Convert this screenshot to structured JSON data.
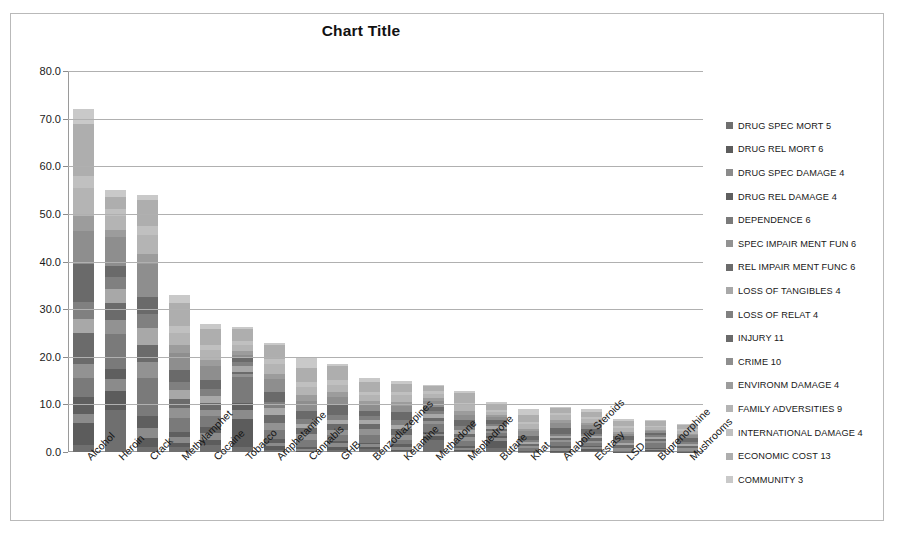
{
  "chart_data": {
    "type": "bar",
    "subtype": "stacked-column",
    "title": "Chart Title",
    "xlabel": "",
    "ylabel": "",
    "ylim": [
      0,
      80
    ],
    "ytick_step": 10,
    "ytick_labels": [
      "0.0",
      "10.0",
      "20.0",
      "30.0",
      "40.0",
      "50.0",
      "60.0",
      "70.0",
      "80.0"
    ],
    "grid": true,
    "legend_position": "right",
    "categories": [
      "Alcohol",
      "Heroin",
      "Crack",
      "Methylamphet",
      "Cocaine",
      "Tobacco",
      "Amphetamine",
      "Cannabis",
      "GHB",
      "Benzodiazepines",
      "Ketamine",
      "Methadone",
      "Mephedrone",
      "Butane",
      "Khat",
      "Anabolic Steroids",
      "Ecstasy",
      "LSD",
      "Buprenorphine",
      "Mushrooms"
    ],
    "totals": [
      72,
      55,
      54,
      33,
      27,
      26.3,
      23,
      20,
      18.5,
      15.5,
      15,
      14,
      12.8,
      10.5,
      9,
      9.5,
      9,
      7,
      6.8,
      6
    ],
    "series": [
      {
        "name": "DRUG SPEC MORT 5",
        "color": "#6f6f6f",
        "values": [
          1.5,
          9.0,
          1.0,
          1.0,
          1.5,
          1.0,
          0.5,
          0.0,
          0.5,
          0.6,
          0.2,
          2.5,
          0.2,
          0.8,
          0.0,
          0.1,
          0.3,
          0.0,
          0.3,
          0.0
        ]
      },
      {
        "name": "DRUG REL MORT 6",
        "color": "#5c5c5c",
        "values": [
          4.5,
          4.0,
          2.0,
          0.8,
          1.2,
          6.0,
          0.8,
          0.3,
          0.6,
          0.5,
          0.3,
          0.8,
          0.3,
          1.6,
          0.0,
          0.2,
          0.4,
          0.0,
          0.2,
          0.0
        ]
      },
      {
        "name": "DRUG SPEC DAMAGE 4",
        "color": "#8b8b8b",
        "values": [
          2.0,
          2.5,
          2.0,
          1.4,
          1.4,
          1.8,
          0.7,
          0.4,
          0.7,
          0.5,
          0.7,
          0.5,
          0.4,
          0.5,
          0.1,
          0.6,
          0.3,
          0.0,
          0.2,
          0.0
        ]
      },
      {
        "name": "DRUG REL DAMAGE 4",
        "color": "#5f5f5f",
        "values": [
          3.5,
          2.0,
          2.5,
          1.0,
          1.3,
          1.4,
          0.8,
          0.4,
          0.6,
          0.4,
          0.5,
          0.4,
          0.4,
          0.4,
          0.1,
          0.4,
          0.3,
          0.1,
          0.2,
          0.1
        ]
      },
      {
        "name": "DEPENDENCE 6",
        "color": "#7a7a7a",
        "values": [
          4.0,
          7.5,
          8.0,
          3.0,
          2.4,
          5.5,
          1.8,
          1.5,
          1.2,
          1.6,
          1.0,
          1.6,
          1.0,
          0.6,
          0.6,
          0.8,
          0.5,
          0.2,
          1.0,
          0.2
        ]
      },
      {
        "name": "SPEC IMPAIR MENT FUN 6",
        "color": "#929292",
        "values": [
          3.0,
          3.0,
          3.5,
          2.0,
          1.4,
          0.6,
          1.6,
          1.2,
          1.0,
          1.2,
          1.2,
          0.7,
          0.8,
          0.5,
          0.4,
          0.4,
          0.5,
          0.6,
          0.4,
          0.5
        ]
      },
      {
        "name": "REL IMPAIR MENT FUNC 6",
        "color": "#6b6b6b",
        "values": [
          6.5,
          3.5,
          3.5,
          2.0,
          1.4,
          0.5,
          1.6,
          1.2,
          1.2,
          1.0,
          1.2,
          0.7,
          0.8,
          0.5,
          0.4,
          0.4,
          0.6,
          0.6,
          0.4,
          0.5
        ]
      },
      {
        "name": "LOSS OF TANGIBLES 4",
        "color": "#a8a8a8",
        "values": [
          3.0,
          3.0,
          3.5,
          1.8,
          1.6,
          1.2,
          1.4,
          1.0,
          1.0,
          0.9,
          1.0,
          0.8,
          0.8,
          0.5,
          0.5,
          0.5,
          0.5,
          0.5,
          0.4,
          0.4
        ]
      },
      {
        "name": "LOSS OF RELAT 4",
        "color": "#808080",
        "values": [
          3.5,
          2.5,
          3.0,
          1.8,
          1.5,
          1.0,
          1.3,
          1.0,
          1.0,
          0.8,
          1.0,
          0.7,
          0.8,
          0.5,
          0.5,
          0.5,
          0.5,
          0.5,
          0.4,
          0.4
        ]
      },
      {
        "name": "INJURY 11",
        "color": "#6a6a6a",
        "values": [
          8.0,
          2.5,
          3.5,
          2.5,
          2.0,
          0.8,
          2.2,
          1.6,
          2.0,
          1.2,
          1.8,
          0.8,
          1.2,
          0.9,
          0.8,
          1.2,
          1.0,
          0.8,
          0.5,
          0.8
        ]
      },
      {
        "name": "CRIME 10",
        "color": "#8e8e8e",
        "values": [
          7.0,
          6.0,
          7.0,
          3.5,
          3.0,
          0.6,
          2.6,
          2.2,
          1.8,
          1.4,
          1.5,
          1.2,
          1.2,
          0.6,
          1.0,
          1.0,
          0.8,
          0.6,
          0.4,
          0.6
        ]
      },
      {
        "name": "ENVIRONM DAMAGE 4",
        "color": "#9c9c9c",
        "values": [
          3.0,
          1.5,
          2.0,
          1.6,
          1.3,
          0.8,
          1.2,
          1.1,
          1.0,
          0.7,
          0.9,
          0.6,
          0.7,
          0.4,
          0.5,
          0.6,
          0.5,
          0.4,
          0.3,
          0.4
        ]
      },
      {
        "name": "FAMILY ADVERSITIES 9",
        "color": "#b4b4b4",
        "values": [
          6.0,
          3.0,
          4.0,
          2.6,
          2.2,
          1.4,
          1.9,
          1.8,
          1.6,
          1.2,
          1.4,
          1.0,
          1.2,
          0.6,
          0.9,
          1.0,
          0.8,
          0.7,
          0.5,
          0.6
        ]
      },
      {
        "name": "INTERNATIONAL DAMAGE 4",
        "color": "#c0c0c0",
        "values": [
          2.5,
          1.5,
          2.0,
          1.4,
          1.2,
          0.7,
          1.1,
          1.0,
          0.9,
          0.7,
          0.8,
          0.6,
          0.6,
          0.4,
          0.5,
          0.5,
          0.4,
          0.4,
          0.3,
          0.3
        ]
      },
      {
        "name": "ECONOMIC COST 13",
        "color": "#aeaeae",
        "values": [
          11.0,
          2.5,
          5.5,
          5.0,
          3.5,
          2.6,
          3.0,
          3.0,
          3.0,
          2.0,
          1.8,
          1.0,
          2.0,
          1.0,
          1.5,
          1.0,
          1.0,
          1.2,
          1.0,
          1.0
        ]
      },
      {
        "name": "COMMUNITY 3",
        "color": "#c9c9c9",
        "values": [
          3.0,
          1.5,
          1.0,
          1.6,
          1.1,
          0.4,
          0.5,
          2.3,
          0.4,
          0.8,
          0.7,
          0.1,
          0.4,
          0.7,
          1.2,
          0.3,
          0.6,
          0.4,
          0.3,
          0.2
        ]
      }
    ]
  },
  "credit": "Elsevier Limited"
}
